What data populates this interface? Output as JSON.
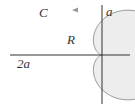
{
  "diagram": {
    "type": "cardioid region",
    "labels": {
      "curve": "C",
      "region": "R",
      "y_intercept": "a",
      "x_extent": "2a"
    },
    "colors": {
      "fill": "#ededed",
      "curve": "#9a9a9a",
      "axes": "#333333",
      "text": "#333333"
    },
    "orientation_arrow": "counterclockwise (pointing left at top)"
  }
}
